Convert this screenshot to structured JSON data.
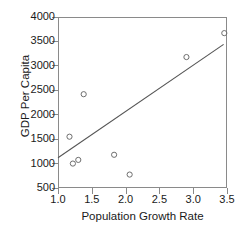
{
  "chart_data": {
    "type": "scatter",
    "title": "",
    "xlabel": "Population Growth Rate",
    "ylabel": "GDP Per Capita",
    "xlim": [
      1.0,
      3.5
    ],
    "ylim": [
      500,
      4000
    ],
    "grid": false,
    "legend": null,
    "xticks": [
      "1.0",
      "1.5",
      "2.0",
      "2.5",
      "3.0",
      "3.5"
    ],
    "xtick_values": [
      1.0,
      1.5,
      2.0,
      2.5,
      3.0,
      3.5
    ],
    "yticks": [
      "4000",
      "3500",
      "3000",
      "2500",
      "2000",
      "1500",
      "1000",
      "500"
    ],
    "ytick_values": [
      4000,
      3500,
      3000,
      2500,
      2000,
      1500,
      1000,
      500
    ],
    "marker": "open-circle",
    "marker_color": "#6e6e6e",
    "points": [
      {
        "x": 1.17,
        "y": 1550
      },
      {
        "x": 1.22,
        "y": 1000
      },
      {
        "x": 1.3,
        "y": 1075
      },
      {
        "x": 1.38,
        "y": 2420
      },
      {
        "x": 1.83,
        "y": 1180
      },
      {
        "x": 2.06,
        "y": 775
      },
      {
        "x": 2.9,
        "y": 3180
      },
      {
        "x": 3.46,
        "y": 3670
      }
    ],
    "trendline": {
      "type": "linear-fit",
      "color": "#555555",
      "x_start": 1.0,
      "y_start": 1120,
      "x_end": 3.45,
      "y_end": 3440
    }
  },
  "axes": {
    "x_title": "Population Growth Rate",
    "y_title": "GDP Per Capita"
  }
}
